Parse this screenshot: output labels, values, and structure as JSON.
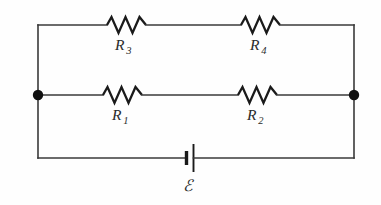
{
  "figure": {
    "kind": "circuit-diagram",
    "background_color": "#fefefe",
    "line_color": "#3a3a3a",
    "symbol_color": "#1a1a1a",
    "label_color": "#2b2b2b"
  },
  "components": {
    "resistors": [
      {
        "id": "R3",
        "label_letter": "R",
        "label_subscript": "3",
        "branch": "top",
        "position": "left"
      },
      {
        "id": "R4",
        "label_letter": "R",
        "label_subscript": "4",
        "branch": "top",
        "position": "right"
      },
      {
        "id": "R1",
        "label_letter": "R",
        "label_subscript": "1",
        "branch": "middle",
        "position": "left"
      },
      {
        "id": "R2",
        "label_letter": "R",
        "label_subscript": "2",
        "branch": "middle",
        "position": "right"
      }
    ],
    "source": {
      "id": "EMF",
      "label": "ℰ",
      "branch": "bottom",
      "symbol": "battery-cell"
    },
    "nodes": [
      {
        "id": "node-left",
        "label": ""
      },
      {
        "id": "node-right",
        "label": ""
      }
    ]
  }
}
